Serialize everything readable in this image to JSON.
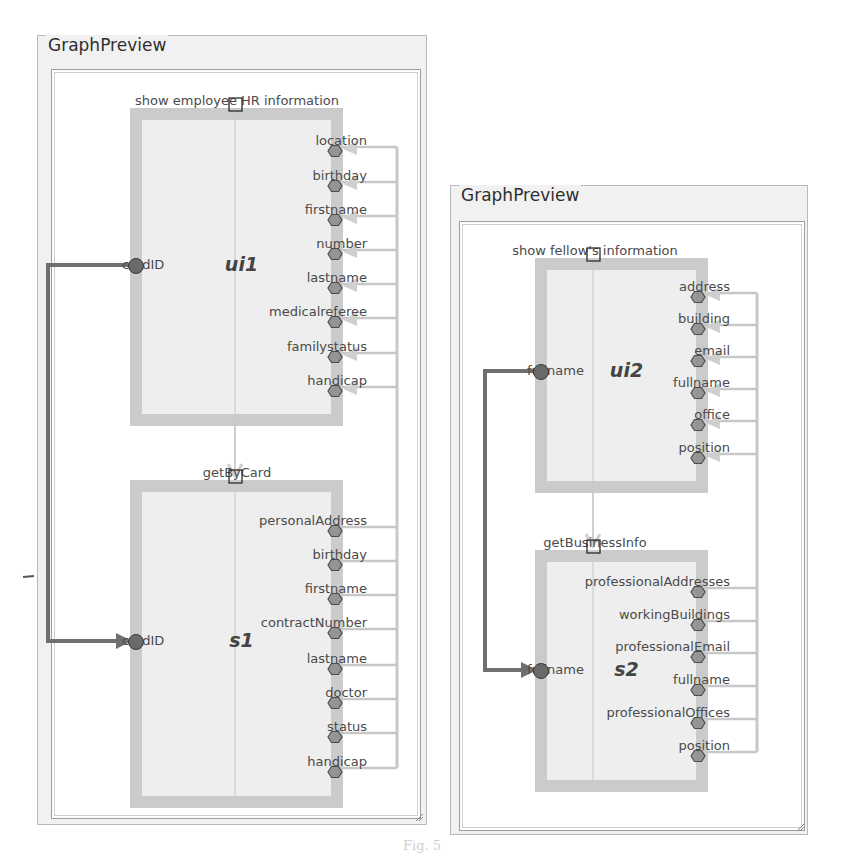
{
  "panels": [
    {
      "id": "left",
      "title": "GraphPreview",
      "outer": {
        "x": 37,
        "y": 35,
        "w": 390,
        "h": 790
      },
      "inner": {
        "x": 50,
        "y": 68,
        "w": 370,
        "h": 750
      },
      "colors": {
        "box_border": "#c9c9c9",
        "box_fill": "#eeeeee",
        "port": "#8f8f8f",
        "wire": "#8a8a8a",
        "return_wire": "#c8c8c8",
        "flow_arrow": "#cfcfcf"
      },
      "upper_node": {
        "name": "ui1",
        "operation": "show employee HR information",
        "box": {
          "x": 130,
          "y": 108,
          "w": 213,
          "h": 318
        },
        "input_port": {
          "label": "cardID",
          "y": 265
        },
        "output_ports": [
          {
            "label": "location",
            "y": 147
          },
          {
            "label": "birthday",
            "y": 182
          },
          {
            "label": "firstname",
            "y": 216
          },
          {
            "label": "number",
            "y": 250
          },
          {
            "label": "lastname",
            "y": 284
          },
          {
            "label": "medicalreferee",
            "y": 318
          },
          {
            "label": "familystatus",
            "y": 353
          },
          {
            "label": "handicap",
            "y": 387
          }
        ]
      },
      "lower_node": {
        "name": "s1",
        "operation": "getByCard",
        "box": {
          "x": 130,
          "y": 480,
          "w": 213,
          "h": 328
        },
        "input_port": {
          "label": "cardID",
          "y": 641
        },
        "output_ports": [
          {
            "label": "personalAddress",
            "y": 527
          },
          {
            "label": "birthday",
            "y": 561
          },
          {
            "label": "firstname",
            "y": 595
          },
          {
            "label": "contractNumber",
            "y": 629
          },
          {
            "label": "lastname",
            "y": 665
          },
          {
            "label": "doctor",
            "y": 699
          },
          {
            "label": "status",
            "y": 733
          },
          {
            "label": "handicap",
            "y": 768
          }
        ]
      },
      "port_x": 335,
      "return_x": 397,
      "left_wire_x": 48,
      "flow_x": 235
    },
    {
      "id": "right",
      "title": "GraphPreview",
      "outer": {
        "x": 450,
        "y": 185,
        "w": 358,
        "h": 650
      },
      "inner": {
        "x": 458,
        "y": 220,
        "w": 346,
        "h": 610
      },
      "colors": {
        "box_border": "#c9c9c9",
        "box_fill": "#eeeeee",
        "port": "#8f8f8f",
        "wire": "#8a8a8a",
        "return_wire": "#c8c8c8",
        "flow_arrow": "#cfcfcf"
      },
      "upper_node": {
        "name": "ui2",
        "operation": "show fellow's information",
        "box": {
          "x": 535,
          "y": 258,
          "w": 173,
          "h": 235
        },
        "input_port": {
          "label": "fullname",
          "y": 371
        },
        "output_ports": [
          {
            "label": "address",
            "y": 293
          },
          {
            "label": "building",
            "y": 325
          },
          {
            "label": "email",
            "y": 357
          },
          {
            "label": "fullname",
            "y": 389
          },
          {
            "label": "office",
            "y": 421
          },
          {
            "label": "position",
            "y": 454
          }
        ]
      },
      "lower_node": {
        "name": "s2",
        "operation": "getBusinessInfo",
        "box": {
          "x": 535,
          "y": 550,
          "w": 173,
          "h": 242
        },
        "input_port": {
          "label": "fullname",
          "y": 670
        },
        "output_ports": [
          {
            "label": "professionalAddresses",
            "y": 588
          },
          {
            "label": "workingBuildings",
            "y": 621
          },
          {
            "label": "professionalEmail",
            "y": 653
          },
          {
            "label": "fullname",
            "y": 686
          },
          {
            "label": "professionalOffices",
            "y": 719
          },
          {
            "label": "position",
            "y": 752
          }
        ]
      },
      "port_x": 698,
      "return_x": 757,
      "left_wire_x": 485,
      "flow_x": 593
    }
  ],
  "caption": "Fig. 5"
}
